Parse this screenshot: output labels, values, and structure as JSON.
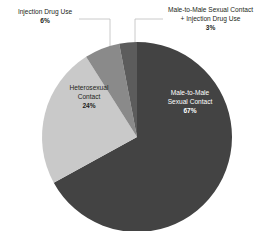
{
  "chart_data": {
    "type": "pie",
    "title": "",
    "subtitle": "",
    "xlabel": "",
    "ylabel": "",
    "legend_position": "none",
    "grid": false,
    "units": "percent",
    "start_angle_deg": 0,
    "direction": "clockwise",
    "categories": [
      "Male-to-Male Sexual Contact",
      "Heterosexual Contact",
      "Injection Drug Use",
      "Male-to-Male Sexual Contact + Injection Drug Use"
    ],
    "values": [
      67,
      24,
      6,
      3
    ],
    "slices": [
      {
        "id": "mmsc",
        "label_line1": "Male-to-Male",
        "label_line2": "Sexual Contact",
        "name": "Male-to-Male Sexual Contact",
        "value": 67,
        "percent_text": "67%",
        "color": "#434343",
        "label_placement": "inside",
        "label_color": "#ffffff"
      },
      {
        "id": "heterosexual",
        "label_line1": "Heterosexual",
        "label_line2": "Contact",
        "name": "Heterosexual Contact",
        "value": 24,
        "percent_text": "24%",
        "color": "#c9c9c9",
        "label_placement": "inside",
        "label_color": "#231f20"
      },
      {
        "id": "idu",
        "label_line1": "Injection Drug Use",
        "label_line2": "",
        "name": "Injection Drug Use",
        "value": 6,
        "percent_text": "6%",
        "color": "#8a8a8a",
        "label_placement": "outside-top-left",
        "label_color": "#231f20"
      },
      {
        "id": "mmsc-idu",
        "label_line1": "Male-to-Male Sexual Contact",
        "label_line2": "+ Injection Drug Use",
        "name": "Male-to-Male Sexual Contact + Injection Drug Use",
        "value": 3,
        "percent_text": "3%",
        "color": "#5c5c5c",
        "label_placement": "outside-top-right",
        "label_color": "#231f20"
      }
    ]
  },
  "colors": {
    "background": "#ffffff",
    "text": "#231f20",
    "leader_line": "#bcbcbc",
    "slice_mmsc": "#434343",
    "slice_heterosexual": "#c9c9c9",
    "slice_idu": "#8a8a8a",
    "slice_mmsc_idu": "#5c5c5c"
  }
}
